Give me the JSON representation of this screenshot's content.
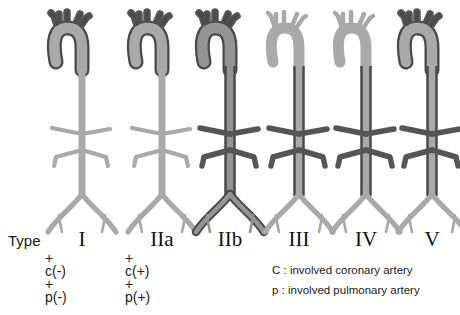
{
  "diagram": {
    "title_word": "Type",
    "colors": {
      "light_vessel": "#a9a9a9",
      "mid_vessel": "#949494",
      "dark_vessel": "#555555",
      "outline_dark": "#4a4a4a",
      "background": "#ffffff",
      "text": "#1a1a1a"
    },
    "columns": [
      {
        "id": "type-1",
        "numeral": "I",
        "cx": 68,
        "arch_involved": true,
        "branches_involved": true,
        "descending_involved": false,
        "iliac_involved": false,
        "body_shade": "light",
        "annotations": [
          "+",
          "c(-)",
          "+",
          "p(-)"
        ],
        "coronary": "c(-)",
        "pulmonary": "p(-)"
      },
      {
        "id": "type-2a",
        "numeral": "IIa",
        "cx": 148,
        "arch_involved": true,
        "branches_involved": true,
        "descending_involved": false,
        "iliac_involved": false,
        "body_shade": "light",
        "annotations": [
          "+",
          "c(+)",
          "+",
          "p(+)"
        ],
        "coronary": "c(+)",
        "pulmonary": "p(+)"
      },
      {
        "id": "type-2b",
        "numeral": "IIb",
        "cx": 216,
        "arch_involved": true,
        "branches_involved": true,
        "descending_involved": true,
        "iliac_involved": true,
        "body_shade": "dark",
        "annotations": [],
        "coronary": "",
        "pulmonary": ""
      },
      {
        "id": "type-3",
        "numeral": "III",
        "cx": 285,
        "arch_involved": false,
        "branches_involved": false,
        "descending_involved": true,
        "iliac_involved": false,
        "body_shade": "light",
        "annotations": [],
        "coronary": "",
        "pulmonary": ""
      },
      {
        "id": "type-4",
        "numeral": "IV",
        "cx": 352,
        "arch_involved": false,
        "branches_involved": false,
        "descending_involved": true,
        "iliac_involved": false,
        "body_shade": "light",
        "annotations": [],
        "coronary": "",
        "pulmonary": ""
      },
      {
        "id": "type-5",
        "numeral": "V",
        "cx": 418,
        "arch_involved": true,
        "branches_involved": true,
        "descending_involved": true,
        "iliac_involved": false,
        "body_shade": "light",
        "annotations": [],
        "coronary": "",
        "pulmonary": ""
      }
    ],
    "annotation_blocks": [
      {
        "id": "ann-type-1",
        "x": 45,
        "y": 252,
        "lines": "+\nc(-)\n+\np(-)"
      },
      {
        "id": "ann-type-2a",
        "x": 125,
        "y": 252,
        "lines": "+\nc(+)\n+\np(+)"
      }
    ],
    "legend": [
      {
        "id": "legend-coronary",
        "text": "C : involved coronary artery",
        "x": 272,
        "y": 264
      },
      {
        "id": "legend-pulmonary",
        "text": "p : involved pulmonary artery",
        "x": 272,
        "y": 284
      }
    ]
  }
}
